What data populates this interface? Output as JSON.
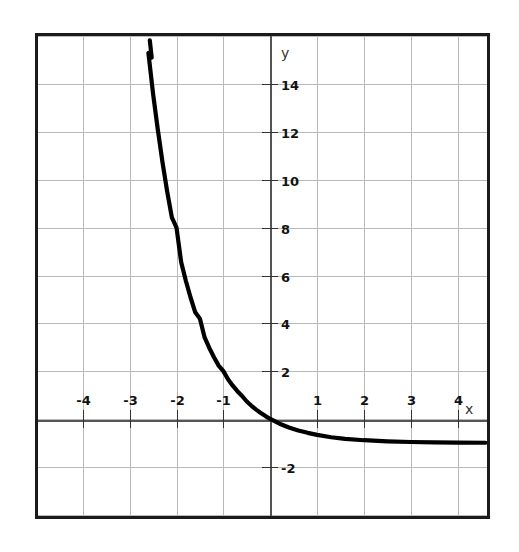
{
  "chart_data": {
    "type": "line",
    "title": "",
    "subtitle": "",
    "xlabel": "x",
    "ylabel": "y",
    "function_label": "y = 3^(-x) - 1",
    "xlim": [
      -5.0,
      4.65
    ],
    "ylim": [
      -4.1,
      16.1
    ],
    "grid": true,
    "grid_spacing_x": 1,
    "grid_spacing_y": 2,
    "legend_position": "none",
    "asymptote_y": -1,
    "x_tick_labels": [
      "-4",
      "-3",
      "-2",
      "-1",
      "1",
      "2",
      "3",
      "4"
    ],
    "x_tick_values": [
      -4,
      -3,
      -2,
      -1,
      1,
      2,
      3,
      4
    ],
    "y_tick_labels": [
      "14",
      "12",
      "10",
      "8",
      "6",
      "4",
      "2",
      "-2"
    ],
    "y_tick_values": [
      14,
      12,
      10,
      8,
      6,
      4,
      2,
      -2
    ],
    "x": [
      -2.8,
      -2.7,
      -2.6,
      -2.5,
      -2.4,
      -2.3,
      -2.2,
      -2.1,
      -2.0,
      -1.9,
      -1.8,
      -1.7,
      -1.6,
      -1.5,
      -1.4,
      -1.3,
      -1.2,
      -1.1,
      -1.0,
      -0.9,
      -0.8,
      -0.7,
      -0.6,
      -0.5,
      -0.4,
      -0.3,
      -0.2,
      -0.1,
      0.0,
      0.2,
      0.4,
      0.6,
      0.8,
      1.0,
      1.3,
      1.6,
      2.0,
      2.5,
      3.0,
      3.5,
      4.0,
      4.6
    ],
    "values": [
      19.22,
      17.16,
      15.31,
      13.59,
      12.11,
      10.74,
      9.52,
      8.43,
      8.0,
      6.55,
      5.77,
      5.08,
      4.46,
      4.196,
      3.41,
      2.97,
      2.58,
      2.23,
      2.0,
      1.66,
      1.39,
      1.16,
      0.96,
      0.73,
      0.55,
      0.39,
      0.25,
      0.12,
      0.0,
      -0.199,
      -0.356,
      -0.48,
      -0.58,
      -0.667,
      -0.765,
      -0.833,
      -0.889,
      -0.936,
      -0.963,
      -0.979,
      -0.988,
      -0.994
    ],
    "curve_color": "#000000",
    "grid_color": "#b9b9b9",
    "axis_color": "#555555",
    "border_color": "#1b1b1b",
    "background_color": "#ffffff"
  },
  "axes": {
    "x_axis_label": "x",
    "y_axis_label": "y"
  }
}
